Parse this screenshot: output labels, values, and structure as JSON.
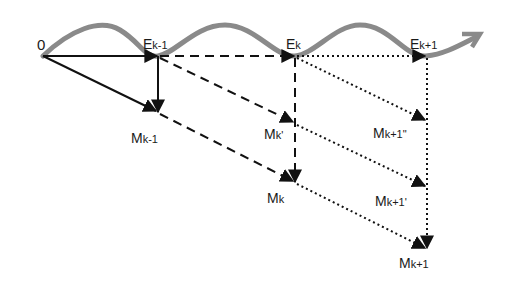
{
  "diagram": {
    "colors": {
      "wave": "#8a8a8a",
      "line": "#111111",
      "background": "#ffffff"
    },
    "nodes": [
      {
        "id": "O",
        "label": "0",
        "sub": "",
        "x": 43,
        "y": 56
      },
      {
        "id": "Ek-1",
        "label": "E",
        "sub": "k-1",
        "x": 158,
        "y": 56
      },
      {
        "id": "Ek",
        "label": "E",
        "sub": "k",
        "x": 295,
        "y": 56
      },
      {
        "id": "Ek+1",
        "label": "E",
        "sub": "k+1",
        "x": 426,
        "y": 56
      },
      {
        "id": "Mk-1",
        "label": "M",
        "sub": "k-1",
        "x": 158,
        "y": 112
      },
      {
        "id": "Mk'",
        "label": "M",
        "sub": "k'",
        "x": 295,
        "y": 123
      },
      {
        "id": "Mk",
        "label": "M",
        "sub": "k",
        "x": 295,
        "y": 182
      },
      {
        "id": "Mk+1''",
        "label": "M",
        "sub": "k+1\"",
        "x": 426,
        "y": 120
      },
      {
        "id": "Mk+1'",
        "label": "M",
        "sub": "k+1'",
        "x": 426,
        "y": 186
      },
      {
        "id": "Mk+1",
        "label": "M",
        "sub": "k+1",
        "x": 426,
        "y": 248
      }
    ],
    "edges": [
      {
        "from": "O",
        "to": "Ek-1",
        "style": "solid"
      },
      {
        "from": "O",
        "to": "Mk-1",
        "style": "solid"
      },
      {
        "from": "Ek-1",
        "to": "Mk-1",
        "style": "solid"
      },
      {
        "from": "Ek-1",
        "to": "Ek",
        "style": "dashed"
      },
      {
        "from": "Ek-1",
        "to": "Mk'",
        "style": "dashed"
      },
      {
        "from": "Mk-1",
        "to": "Mk",
        "style": "dashed"
      },
      {
        "from": "Ek",
        "to": "Mk",
        "style": "dashed"
      },
      {
        "from": "Ek",
        "to": "Ek+1",
        "style": "dotted"
      },
      {
        "from": "Ek",
        "to": "Mk+1''",
        "style": "dotted"
      },
      {
        "from": "Mk'",
        "to": "Mk+1'",
        "style": "dotted"
      },
      {
        "from": "Mk",
        "to": "Mk+1",
        "style": "dotted"
      },
      {
        "from": "Ek+1",
        "to": "Mk+1",
        "style": "dotted"
      }
    ],
    "labels": {
      "O": {
        "main": "0",
        "sub": ""
      },
      "Ek_1": {
        "main": "E",
        "sub": "k-1"
      },
      "Ek": {
        "main": "E",
        "sub": "k"
      },
      "Ek1": {
        "main": "E",
        "sub": "k+1"
      },
      "Mk_1": {
        "main": "M",
        "sub": "k-1"
      },
      "Mkp": {
        "main": "M",
        "sub": "k'"
      },
      "Mk": {
        "main": "M",
        "sub": "k"
      },
      "Mk1pp": {
        "main": "M",
        "sub": "k+1\""
      },
      "Mk1p": {
        "main": "M",
        "sub": "k+1'"
      },
      "Mk1": {
        "main": "M",
        "sub": "k+1"
      }
    }
  }
}
